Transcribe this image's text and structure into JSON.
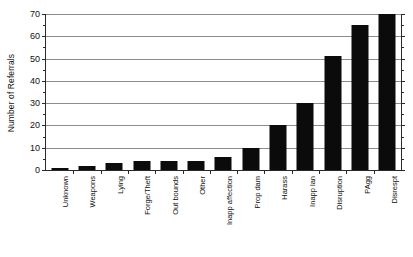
{
  "chart_data": {
    "type": "bar",
    "title": "",
    "subtitle": "",
    "xlabel": "",
    "ylabel": "Number of Referrals",
    "ylim": [
      0,
      70
    ],
    "ytick_step": 10,
    "yminor_step": 5,
    "grid": true,
    "legend": false,
    "legend_position": "none",
    "bar_color": "#0b0b0b",
    "grid_color": "#8c8c8c",
    "axis_color": "#2a2a2a",
    "categories": [
      "Unknown",
      "Weapons",
      "Lying",
      "Forge/Theft",
      "Out bounds",
      "Other",
      "Inapp affection",
      "Prop dam",
      "Harass",
      "Inapp lan",
      "Disruption",
      "PAgg",
      "Disrespt"
    ],
    "values": [
      1,
      2,
      3,
      4,
      4,
      4,
      6,
      10,
      20,
      30,
      51,
      65,
      70
    ],
    "yticks": [
      0,
      10,
      20,
      30,
      40,
      50,
      60,
      70
    ],
    "ytick_labels": [
      "0",
      "10",
      "20",
      "30",
      "40",
      "50",
      "60",
      "70"
    ]
  }
}
